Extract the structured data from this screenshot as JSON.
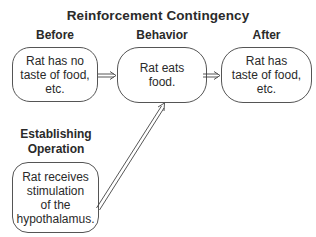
{
  "title": "Reinforcement Contingency",
  "headers": {
    "before": "Before",
    "behavior": "Behavior",
    "after": "After",
    "establishing_operation": "Establishing\nOperation"
  },
  "boxes": {
    "before": "Rat has no\ntaste of food,\netc.",
    "behavior": "Rat eats\nfood.",
    "after": "Rat has\ntaste of food,\netc.",
    "establishing_operation": "Rat receives\nstimulation\nof the\nhypothalamus."
  },
  "arrows": [
    {
      "from": "before",
      "to": "behavior",
      "style": "double-line"
    },
    {
      "from": "behavior",
      "to": "after",
      "style": "double-line"
    },
    {
      "from": "establishing_operation",
      "to": "behavior",
      "style": "double-line"
    }
  ]
}
